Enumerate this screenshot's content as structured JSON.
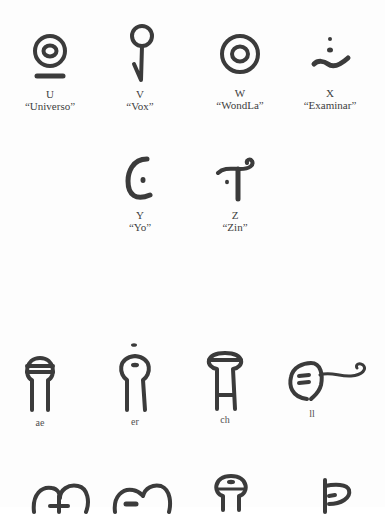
{
  "alphabet_chart": {
    "row1": [
      {
        "letter": "U",
        "word": "“Universo”",
        "glyph": "concentric-circle-with-underline"
      },
      {
        "letter": "V",
        "word": "“Vox”",
        "glyph": "circle-on-checkmark-stem"
      },
      {
        "letter": "W",
        "word": "“WondLa”",
        "glyph": "concentric-circles"
      },
      {
        "letter": "X",
        "word": "“Examinar”",
        "glyph": "two-dots-over-wave"
      }
    ],
    "row2": [
      {
        "letter": "Y",
        "word": "“Yo”",
        "glyph": "open-arc-with-dot"
      },
      {
        "letter": "Z",
        "word": "“Zin”",
        "glyph": "curled-t-with-dot"
      }
    ],
    "row3": [
      {
        "label": "ae",
        "glyph": "keyhole-with-band"
      },
      {
        "label": "er",
        "glyph": "keyhole-with-dots"
      },
      {
        "label": "ch",
        "glyph": "pedestal-with-band"
      },
      {
        "label": "ll",
        "glyph": "circle-with-bars-and-curled-tail"
      }
    ],
    "row4": [
      {
        "glyph": "double-loop-with-bar"
      },
      {
        "glyph": "double-loop-with-dash"
      },
      {
        "glyph": "keyhole-with-dash"
      },
      {
        "glyph": "hooked-stem-loop"
      }
    ]
  }
}
